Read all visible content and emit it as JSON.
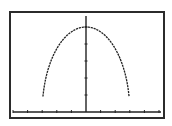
{
  "colors": {
    "background": "#ffffff",
    "frame": "#2b2b2b",
    "axis": "#222222",
    "curve": "#222222"
  },
  "chart_data": {
    "type": "line",
    "title": "",
    "xlabel": "",
    "ylabel": "",
    "xlim": [
      -5.2,
      5.2
    ],
    "ylim": [
      -0.3,
      5.7
    ],
    "grid": false,
    "legend": null,
    "x_ticks": [
      -5,
      -4,
      -3,
      -2,
      -1,
      1,
      2,
      3,
      4,
      5
    ],
    "y_ticks": [
      1,
      2,
      3,
      4,
      5
    ],
    "series": [
      {
        "name": "semi-ellipse",
        "description": "dome-shaped curve symmetric about y-axis",
        "x": [
          -2.95,
          -2.8,
          -2.5,
          -2.0,
          -1.5,
          -1.0,
          -0.5,
          0,
          0.5,
          1.0,
          1.5,
          2.0,
          2.5,
          2.8,
          2.95
        ],
        "y": [
          0.45,
          1.8,
          2.76,
          3.73,
          4.33,
          4.71,
          4.93,
          5.0,
          4.93,
          4.71,
          4.33,
          3.73,
          2.76,
          1.8,
          0.45
        ]
      }
    ]
  }
}
